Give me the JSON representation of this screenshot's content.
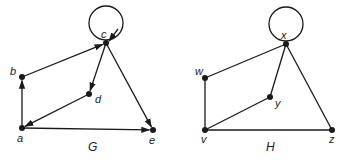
{
  "graphs": [
    {
      "name": "G",
      "directed": true,
      "title_pos": [
        88,
        151
      ],
      "nodes": [
        {
          "id": "a",
          "label": "a",
          "x": 22,
          "y": 128,
          "lx": 17,
          "ly": 142
        },
        {
          "id": "b",
          "label": "b",
          "x": 22,
          "y": 77,
          "lx": 10,
          "ly": 75
        },
        {
          "id": "c",
          "label": "c",
          "x": 106,
          "y": 43,
          "lx": 101,
          "ly": 38
        },
        {
          "id": "d",
          "label": "d",
          "x": 89,
          "y": 94,
          "lx": 95,
          "ly": 103
        },
        {
          "id": "e",
          "label": "e",
          "x": 153,
          "y": 130,
          "lx": 149,
          "ly": 144
        }
      ],
      "edges": [
        {
          "from": "a",
          "to": "b"
        },
        {
          "from": "b",
          "to": "c"
        },
        {
          "from": "c",
          "to": "d"
        },
        {
          "from": "d",
          "to": "a"
        },
        {
          "from": "a",
          "to": "e"
        },
        {
          "from": "c",
          "to": "e"
        },
        {
          "from": "c",
          "to": "c",
          "loop": {
            "cx": 106,
            "cy": 23,
            "r": 17
          }
        }
      ]
    },
    {
      "name": "H",
      "directed": false,
      "title_pos": [
        266,
        151
      ],
      "nodes": [
        {
          "id": "v",
          "label": "v",
          "x": 205,
          "y": 130,
          "lx": 201,
          "ly": 143
        },
        {
          "id": "w",
          "label": "w",
          "x": 205,
          "y": 78,
          "lx": 195,
          "ly": 75
        },
        {
          "id": "x",
          "label": "x",
          "x": 286,
          "y": 44,
          "lx": 281,
          "ly": 39
        },
        {
          "id": "y",
          "label": "y",
          "x": 270,
          "y": 97,
          "lx": 275,
          "ly": 107
        },
        {
          "id": "z",
          "label": "z",
          "x": 332,
          "y": 130,
          "lx": 329,
          "ly": 143
        }
      ],
      "edges": [
        {
          "from": "v",
          "to": "w"
        },
        {
          "from": "w",
          "to": "x"
        },
        {
          "from": "x",
          "to": "y"
        },
        {
          "from": "y",
          "to": "v"
        },
        {
          "from": "v",
          "to": "z"
        },
        {
          "from": "x",
          "to": "z"
        },
        {
          "from": "x",
          "to": "x",
          "loop": {
            "cx": 286,
            "cy": 24,
            "r": 17
          }
        }
      ]
    }
  ]
}
